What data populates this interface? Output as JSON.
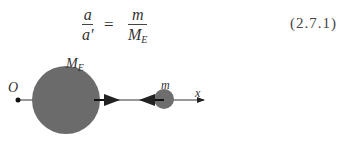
{
  "equation": {
    "lhs_numerator": "a",
    "lhs_denominator": "a'",
    "equals": "=",
    "rhs_numerator": "m",
    "rhs_denominator_main": "M",
    "rhs_denominator_sub": "E",
    "number": "(2.7.1)"
  },
  "figure": {
    "origin_label": "O",
    "earth_label_main": "M",
    "earth_label_sub": "E",
    "body_label": "m",
    "axis_label": "x",
    "colors": {
      "sphere": "#6b6b6b",
      "line": "#333333"
    }
  }
}
